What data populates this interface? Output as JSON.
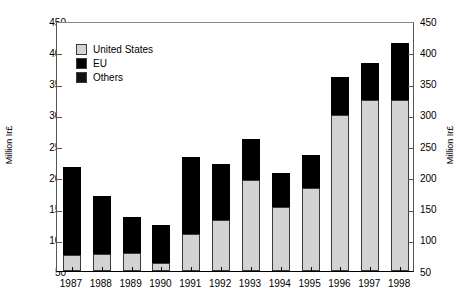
{
  "chart_data": {
    "type": "bar",
    "stacked": true,
    "title": "",
    "subtitle": "",
    "xlabel": "",
    "ylabel": "Million Ir£",
    "ylabel_right": "Million Ir£",
    "categories": [
      "1987",
      "1988",
      "1989",
      "1990",
      "1991",
      "1992",
      "1993",
      "1994",
      "1995",
      "1996",
      "1997",
      "1998"
    ],
    "series": [
      {
        "name": "United States",
        "color": "#d3d3d3",
        "values": [
          75,
          78,
          79,
          63,
          110,
          131,
          195,
          152,
          183,
          300,
          324,
          324
        ]
      },
      {
        "name": "EU",
        "color": "#000000",
        "values": [
          142,
          92,
          57,
          61,
          123,
          90,
          66,
          55,
          53,
          60,
          59,
          91
        ]
      },
      {
        "name": "Others",
        "color": "#000000",
        "values": [
          0,
          0,
          0,
          0,
          0,
          0,
          0,
          0,
          0,
          0,
          0,
          0
        ]
      }
    ],
    "totals": [
      217,
      170,
      136,
      124,
      233,
      221,
      261,
      207,
      236,
      360,
      383,
      415
    ],
    "ylim": [
      50,
      450
    ],
    "yticks": [
      50,
      100,
      150,
      200,
      250,
      300,
      350,
      400,
      450
    ],
    "ytick_labels": [
      "50",
      "100",
      "150",
      "200",
      "250",
      "300",
      "350",
      "400",
      "450"
    ],
    "grid": false,
    "legend_position": "top-left",
    "legend": [
      {
        "label": "United States",
        "color": "#d3d3d3"
      },
      {
        "label": "EU",
        "color": "#000000"
      },
      {
        "label": "Others",
        "color": "#111111"
      }
    ]
  }
}
